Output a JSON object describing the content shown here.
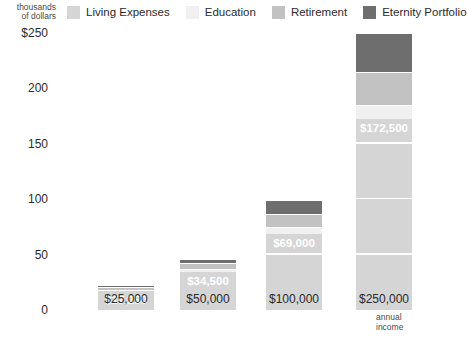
{
  "legend": {
    "axis_caption_line1": "thousands",
    "axis_caption_line2": "of dollars",
    "items": [
      {
        "label": "Living Expenses",
        "color": "#d5d5d5"
      },
      {
        "label": "Education",
        "color": "#f0f0f0"
      },
      {
        "label": "Retirement",
        "color": "#c2c2c2"
      },
      {
        "label": "Eternity Portfolio",
        "color": "#6e6e6e"
      }
    ]
  },
  "xaxis_caption_line1": "annual",
  "xaxis_caption_line2": "income",
  "chart_data": {
    "type": "bar",
    "subtype": "stacked-bar",
    "title": "",
    "xlabel": "annual income",
    "ylabel": "thousands of dollars",
    "ylim": [
      0,
      250
    ],
    "yticks": [
      0,
      50,
      100,
      150,
      200,
      250
    ],
    "ytick_labels": [
      "0",
      "50",
      "100",
      "150",
      "200",
      "$250"
    ],
    "grid": false,
    "legend_position": "top",
    "categories": [
      "$25,000",
      "$50,000",
      "$100,000",
      "$250,000"
    ],
    "series": [
      {
        "name": "Living Expenses",
        "color": "#d5d5d5",
        "values": [
          17.25,
          34.5,
          69,
          172.5
        ]
      },
      {
        "name": "Education",
        "color": "#f0f0f0",
        "values": [
          1.25,
          2.5,
          5.5,
          12.5
        ]
      },
      {
        "name": "Retirement",
        "color": "#c2c2c2",
        "values": [
          2.5,
          5,
          12.5,
          30
        ]
      },
      {
        "name": "Eternity Portfolio",
        "color": "#6e6e6e",
        "values": [
          1.75,
          4,
          12.5,
          35
        ]
      }
    ],
    "data_labels": [
      "$17,250",
      "$34,500",
      "$69,000",
      "$172,500"
    ],
    "totals": [
      22.75,
      46,
      99.5,
      250
    ]
  }
}
